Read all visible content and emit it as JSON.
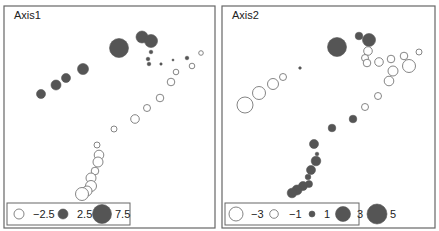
{
  "colors": {
    "filled": "#555555",
    "open_stroke": "#777777",
    "frame": "#666666",
    "background": "#ffffff"
  },
  "chart_data": [
    {
      "type": "scatter",
      "title": "Axis1",
      "panel": {
        "x": 4,
        "y": 6,
        "w": 211,
        "h": 222
      },
      "encoding": "bubble size = |value|; filled = positive, open = negative",
      "legend": {
        "box": {
          "x": 7,
          "y": 203,
          "w": 123,
          "h": 22
        },
        "entries": [
          {
            "value": -2.5,
            "label": "−2.5",
            "r": 5,
            "filled": false,
            "cx": 19,
            "label_x": 33
          },
          {
            "value": 2.5,
            "label": "2.5",
            "r": 5,
            "filled": true,
            "cx": 63,
            "label_x": 77
          },
          {
            "value": 7.5,
            "label": "7.5",
            "r": 9.5,
            "filled": true,
            "cx": 102,
            "label_x": 115
          }
        ]
      },
      "points": [
        {
          "x": 119,
          "y": 48,
          "r": 9.5,
          "v": 7.5
        },
        {
          "x": 142,
          "y": 37,
          "r": 6,
          "v": 4.5
        },
        {
          "x": 151,
          "y": 41,
          "r": 6.5,
          "v": 5
        },
        {
          "x": 151,
          "y": 52,
          "r": 1.8,
          "v": 0.5
        },
        {
          "x": 148,
          "y": 59,
          "r": 1.8,
          "v": 0.5
        },
        {
          "x": 149,
          "y": 64,
          "r": 1.8,
          "v": 0.5
        },
        {
          "x": 161,
          "y": 64,
          "r": 1.2,
          "v": 0.3
        },
        {
          "x": 173,
          "y": 60,
          "r": 1,
          "v": 0.2
        },
        {
          "x": 187,
          "y": 58,
          "r": 1.8,
          "v": 0.5
        },
        {
          "x": 83,
          "y": 69,
          "r": 5.5,
          "v": 4
        },
        {
          "x": 66,
          "y": 78,
          "r": 4.5,
          "v": 3.5
        },
        {
          "x": 56,
          "y": 85,
          "r": 5,
          "v": 3.5
        },
        {
          "x": 41,
          "y": 94,
          "r": 4.5,
          "v": 3
        },
        {
          "x": 201,
          "y": 53,
          "r": 2.3,
          "v": -1
        },
        {
          "x": 192,
          "y": 66,
          "r": 2.8,
          "v": -1.2
        },
        {
          "x": 176,
          "y": 72,
          "r": 2.8,
          "v": -1.2
        },
        {
          "x": 171,
          "y": 82,
          "r": 3.8,
          "v": -1.8
        },
        {
          "x": 160,
          "y": 98,
          "r": 3.8,
          "v": -1.8
        },
        {
          "x": 147,
          "y": 108,
          "r": 3.5,
          "v": -1.6
        },
        {
          "x": 135,
          "y": 119,
          "r": 4.3,
          "v": -2
        },
        {
          "x": 114,
          "y": 129,
          "r": 3,
          "v": -1.3
        },
        {
          "x": 97,
          "y": 145,
          "r": 3,
          "v": -1.3
        },
        {
          "x": 99,
          "y": 155,
          "r": 4.8,
          "v": -2.3
        },
        {
          "x": 98,
          "y": 162,
          "r": 5,
          "v": -2.4
        },
        {
          "x": 95,
          "y": 171,
          "r": 3.8,
          "v": -1.8
        },
        {
          "x": 91,
          "y": 178,
          "r": 5,
          "v": -2.4
        },
        {
          "x": 91,
          "y": 186,
          "r": 5.5,
          "v": -2.6
        },
        {
          "x": 87,
          "y": 191,
          "r": 5,
          "v": -2.4
        },
        {
          "x": 82,
          "y": 194,
          "r": 6.5,
          "v": -3
        }
      ]
    },
    {
      "type": "scatter",
      "title": "Axis2",
      "panel": {
        "x": 222,
        "y": 6,
        "w": 213,
        "h": 222
      },
      "encoding": "bubble size = |value|; filled = positive, open = negative",
      "legend": {
        "box": {
          "x": 225,
          "y": 203,
          "w": 134,
          "h": 22
        },
        "entries": [
          {
            "value": -3,
            "label": "−3",
            "r": 7,
            "filled": false,
            "cx": 236,
            "label_x": 251
          },
          {
            "value": -1,
            "label": "−1",
            "r": 4.3,
            "filled": false,
            "cx": 274,
            "label_x": 289
          },
          {
            "value": 1,
            "label": "1",
            "r": 3,
            "filled": true,
            "cx": 312,
            "label_x": 324
          },
          {
            "value": 3,
            "label": "3",
            "r": 7.5,
            "filled": true,
            "cx": 343,
            "label_x": 357
          },
          {
            "value": 5,
            "label": "5",
            "r": 10,
            "filled": true,
            "cx": 377,
            "label_x": 390
          }
        ]
      },
      "points": [
        {
          "x": 337,
          "y": 47,
          "r": 9.5,
          "v": 4.8
        },
        {
          "x": 359,
          "y": 36,
          "r": 3.8,
          "v": 1.5
        },
        {
          "x": 369,
          "y": 40,
          "r": 6.5,
          "v": 3
        },
        {
          "x": 300,
          "y": 68,
          "r": 1.3,
          "v": 0.3
        },
        {
          "x": 368,
          "y": 51,
          "r": 4.3,
          "v": -1
        },
        {
          "x": 365,
          "y": 58,
          "r": 3.5,
          "v": -0.8
        },
        {
          "x": 367,
          "y": 63,
          "r": 3.8,
          "v": -0.9
        },
        {
          "x": 379,
          "y": 62,
          "r": 4.3,
          "v": -1
        },
        {
          "x": 391,
          "y": 59,
          "r": 3.8,
          "v": -0.9
        },
        {
          "x": 404,
          "y": 56,
          "r": 3.8,
          "v": -0.9
        },
        {
          "x": 419,
          "y": 52,
          "r": 3,
          "v": -0.6
        },
        {
          "x": 393,
          "y": 71,
          "r": 5,
          "v": -1.5
        },
        {
          "x": 409,
          "y": 66,
          "r": 6.5,
          "v": -2
        },
        {
          "x": 389,
          "y": 81,
          "r": 4.8,
          "v": -1.4
        },
        {
          "x": 378,
          "y": 96,
          "r": 3.5,
          "v": -0.8
        },
        {
          "x": 365,
          "y": 107,
          "r": 3.5,
          "v": -0.8
        },
        {
          "x": 283,
          "y": 77,
          "r": 3.5,
          "v": -0.8
        },
        {
          "x": 273,
          "y": 84,
          "r": 5.5,
          "v": -1.6
        },
        {
          "x": 259,
          "y": 93,
          "r": 6.5,
          "v": -2
        },
        {
          "x": 245,
          "y": 105,
          "r": 8,
          "v": -2.8
        },
        {
          "x": 353,
          "y": 119,
          "r": 3.8,
          "v": 1.5
        },
        {
          "x": 332,
          "y": 128,
          "r": 3.8,
          "v": 1.5
        },
        {
          "x": 314,
          "y": 144,
          "r": 4.5,
          "v": 2
        },
        {
          "x": 317,
          "y": 154,
          "r": 1.8,
          "v": 0.5
        },
        {
          "x": 316,
          "y": 161,
          "r": 4.8,
          "v": 2.2
        },
        {
          "x": 311,
          "y": 170,
          "r": 4.5,
          "v": 2
        },
        {
          "x": 308,
          "y": 177,
          "r": 2.8,
          "v": 1
        },
        {
          "x": 309,
          "y": 184,
          "r": 3.5,
          "v": 1.3
        },
        {
          "x": 303,
          "y": 186,
          "r": 4.5,
          "v": 2
        },
        {
          "x": 297,
          "y": 190,
          "r": 5,
          "v": 2.3
        },
        {
          "x": 292,
          "y": 193,
          "r": 4.8,
          "v": 2.1
        }
      ]
    }
  ]
}
